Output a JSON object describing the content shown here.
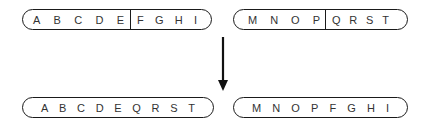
{
  "before": {
    "chromosome_1": {
      "segment_a": [
        "A",
        "B",
        "C",
        "D",
        "E"
      ],
      "segment_b": [
        "F",
        "G",
        "H",
        "I"
      ]
    },
    "chromosome_2": {
      "segment_a": [
        "M",
        "N",
        "O",
        "P"
      ],
      "segment_b": [
        "Q",
        "R",
        "S",
        "T"
      ]
    }
  },
  "after": {
    "chromosome_1": {
      "letters": [
        "A",
        "B",
        "C",
        "D",
        "E",
        "Q",
        "R",
        "S",
        "T"
      ]
    },
    "chromosome_2": {
      "letters": [
        "M",
        "N",
        "O",
        "P",
        "F",
        "G",
        "H",
        "I"
      ]
    }
  },
  "arrow": {
    "direction": "down",
    "color": "#111111"
  }
}
